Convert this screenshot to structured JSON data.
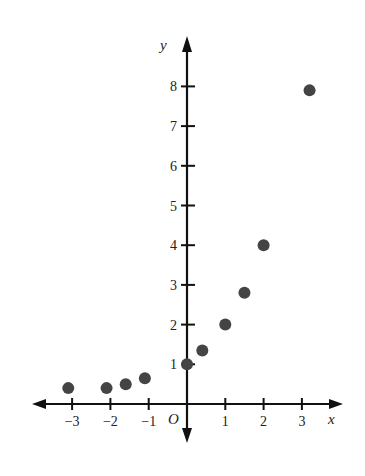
{
  "chart_data": {
    "type": "scatter",
    "title": "",
    "xlabel": "x",
    "ylabel": "y",
    "origin_label": "O",
    "xlim": [
      -4,
      4
    ],
    "ylim": [
      -0.5,
      8.8
    ],
    "grid": false,
    "legend": null,
    "x_ticks": [
      -3,
      -2,
      -1,
      1,
      2,
      3
    ],
    "x_tick_labels": [
      "−3",
      "−2",
      "−1",
      "1",
      "2",
      "3"
    ],
    "y_ticks": [
      1,
      2,
      3,
      4,
      5,
      6,
      7,
      8
    ],
    "y_tick_labels": [
      "1",
      "2",
      "3",
      "4",
      "5",
      "6",
      "7",
      "8"
    ],
    "series": [
      {
        "name": "points",
        "color": "#444444",
        "points": [
          {
            "x": -3.1,
            "y": 0.4
          },
          {
            "x": -2.1,
            "y": 0.4
          },
          {
            "x": -1.6,
            "y": 0.5
          },
          {
            "x": -1.1,
            "y": 0.65
          },
          {
            "x": 0.0,
            "y": 1.0
          },
          {
            "x": 0.4,
            "y": 1.35
          },
          {
            "x": 1.0,
            "y": 2.0
          },
          {
            "x": 1.5,
            "y": 2.8
          },
          {
            "x": 2.0,
            "y": 4.0
          },
          {
            "x": 3.2,
            "y": 7.9
          }
        ]
      }
    ]
  },
  "colors": {
    "axis": "#111111",
    "point": "#444444",
    "background": "#ffffff"
  }
}
